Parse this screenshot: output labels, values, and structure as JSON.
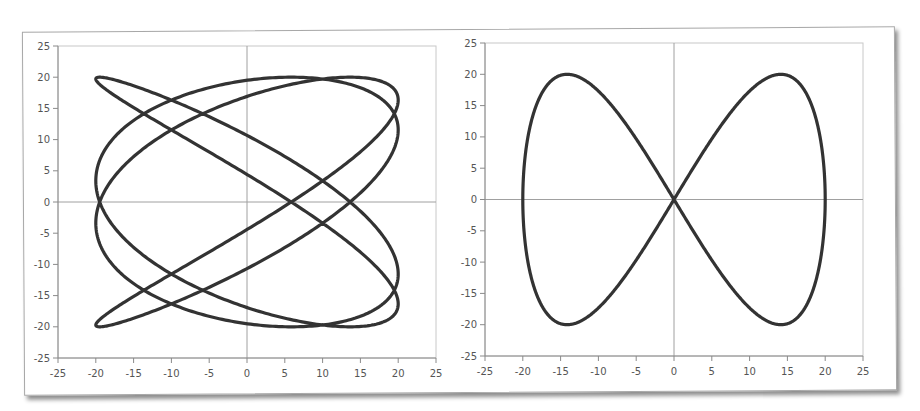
{
  "chart_data": [
    {
      "type": "line",
      "title": "",
      "xlabel": "",
      "ylabel": "",
      "description": "Lissajous curve x = 20 sin(4t - 77deg), y = 20 sin(3t)",
      "parametric": {
        "ax": 20,
        "fx": 4,
        "phase_x_deg": -77,
        "ay": 20,
        "fy": 3,
        "phase_y_deg": 0
      },
      "xlim": [
        -25,
        25
      ],
      "ylim": [
        -25,
        25
      ],
      "xticks": [
        "-25",
        "-20",
        "-15",
        "-10",
        "-5",
        "0",
        "5",
        "10",
        "15",
        "20",
        "25"
      ],
      "yticks": [
        "25",
        "20",
        "15",
        "10",
        "5",
        "0",
        "-5",
        "-10",
        "-15",
        "-20",
        "-25"
      ],
      "grid": false,
      "line_color": "#333333",
      "series": [
        {
          "name": "lissajous-4-3"
        }
      ]
    },
    {
      "type": "line",
      "title": "",
      "xlabel": "",
      "ylabel": "",
      "description": "Figure-eight Lissajous curve x = 20 sin(t), y = 20 sin(2t)",
      "parametric": {
        "ax": 20,
        "fx": 1,
        "phase_x_deg": 0,
        "ay": 20,
        "fy": 2,
        "phase_y_deg": 0
      },
      "xlim": [
        -25,
        25
      ],
      "ylim": [
        -25,
        25
      ],
      "xticks": [
        "-25",
        "-20",
        "-15",
        "-10",
        "-5",
        "0",
        "5",
        "10",
        "15",
        "20",
        "25"
      ],
      "yticks": [
        "25",
        "20",
        "15",
        "10",
        "5",
        "0",
        "-5",
        "-10",
        "-15",
        "-20",
        "-25"
      ],
      "grid": false,
      "line_color": "#333333",
      "series": [
        {
          "name": "lissajous-1-2"
        }
      ]
    }
  ]
}
